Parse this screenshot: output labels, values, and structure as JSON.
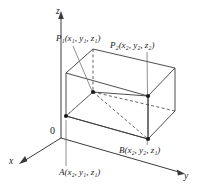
{
  "figure": {
    "background_color": "#ffffff",
    "line_color": "#3a3a3a",
    "dot_color": "#1a1a1a",
    "axes": {
      "z_label": "z",
      "x_label": "x",
      "y_label": "y",
      "origin_label": "0"
    },
    "points": {
      "p1": {
        "name": "P",
        "subscript": "1",
        "coords": "(x₁, y₁, z₁)",
        "full_label": "P₁(x₁, y₁, z₁)"
      },
      "p2": {
        "name": "P",
        "subscript": "2",
        "coords": "(x₂, y₂, z₂)",
        "full_label": "P₂(x₂, y₂, z₂)"
      },
      "a": {
        "name": "A",
        "coords": "(x₂, y₁, z₁)",
        "full_label": "A(x₂, y₁, z₁)"
      },
      "b": {
        "name": "B",
        "coords": "(x₂, y₂, z₁)",
        "full_label": "B(x₂, y₂, z₁)"
      }
    }
  }
}
